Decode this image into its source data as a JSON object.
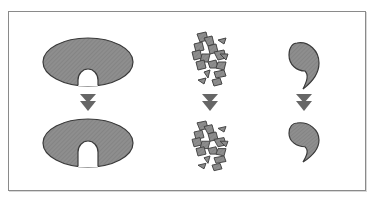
{
  "diagram": {
    "colors": {
      "frame_border": "#8a8a8a",
      "shape_fill": "#8c8c8c",
      "shape_stroke": "#3a3a3a",
      "arrow_fill": "#666666",
      "background": "#ffffff"
    },
    "columns": [
      {
        "name": "notched-ellipse",
        "top_shape": "notched-ellipse",
        "arrow": "down-arrow",
        "bottom_shape": "notched-ellipse"
      },
      {
        "name": "fragments",
        "top_shape": "scattered-fragments",
        "arrow": "down-arrow",
        "bottom_shape": "scattered-fragments"
      },
      {
        "name": "comma-shape",
        "top_shape": "comma-shape",
        "arrow": "down-arrow",
        "bottom_shape": "comma-shape"
      }
    ]
  }
}
